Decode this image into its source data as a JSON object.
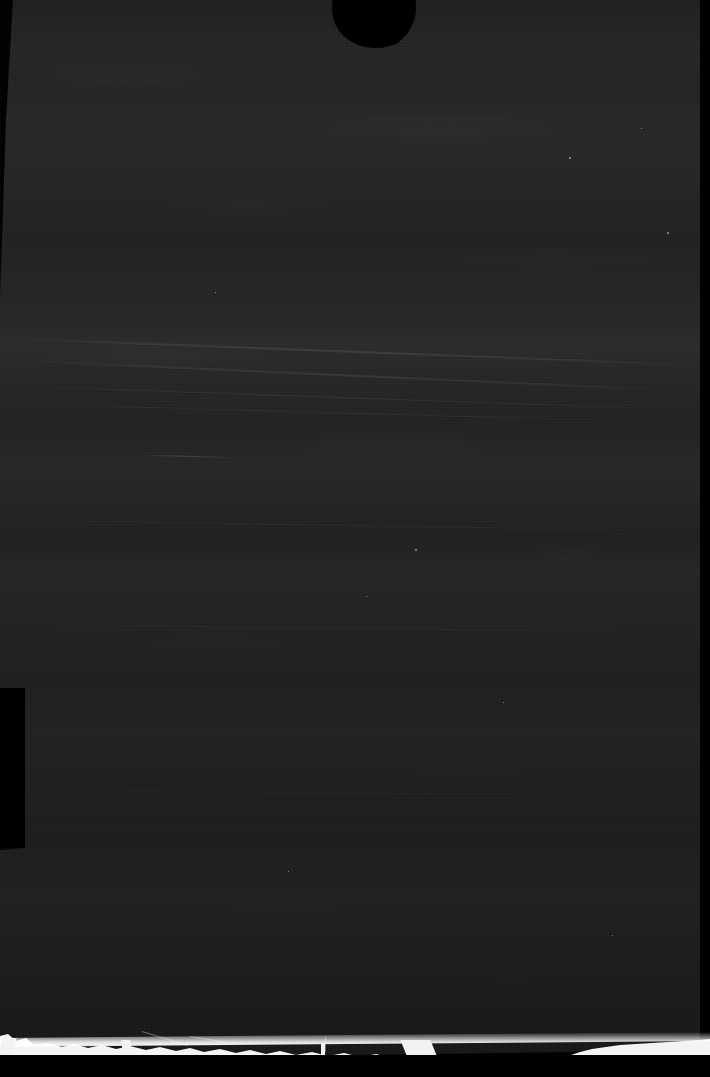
{
  "image": {
    "kind": "scanned-film-negative",
    "title": "Scanned Dark Film Negative",
    "caption": "Heavily underexposed scan of a torn sheet",
    "width_px": 710,
    "height_px": 1077,
    "legible_text": "none",
    "notes": "No readable text, labels, numbers or UI controls are present in the pixels."
  },
  "palette": {
    "background": "#000000",
    "surface_dark": "#1c1c1d",
    "surface_mid": "#232324",
    "surface_light": "#2a2a2b",
    "cutout": "#000000",
    "torn_edge_white": "#f4f4f2",
    "speck": "#ffffff"
  },
  "regions": {
    "surface": {
      "name": "emulsion-surface",
      "description": "Large dark charcoal textured field occupying most of the frame, with soft horizontal tonal banding and fine vertical scan grain."
    },
    "top_notch": {
      "name": "top-circular-cutout",
      "description": "Black rounded cutout at the top centre of the sheet.",
      "x": 332,
      "y": -30,
      "width": 84,
      "height": 78
    },
    "left_notch": {
      "name": "left-rectangular-cutout",
      "description": "Black rectangular step cut into the left edge.",
      "x": 0,
      "y": 688,
      "width": 25,
      "height": 160
    },
    "left_edge": {
      "name": "left-border-strip",
      "description": "Black border strip down the left side, widest at the top and tapering toward the bottom."
    },
    "right_edge": {
      "name": "right-border-strip",
      "description": "Narrow black border strip down the right side.",
      "x": 700,
      "width": 10
    },
    "bottom_tear": {
      "name": "torn-bottom-edge",
      "description": "Bright white ragged torn paper edge running across the bottom, heavier and more irregular on the left half, thinning to a clean hairline on the right.",
      "y": 1032,
      "height": 28
    }
  },
  "artifacts": {
    "streaks": [
      {
        "name": "diagonal-light-streak-1",
        "x": 20,
        "y": 338,
        "width": 660,
        "height": 2,
        "rotate_deg": 2.2,
        "opacity": 0.55
      },
      {
        "name": "diagonal-light-streak-2",
        "x": 30,
        "y": 360,
        "width": 640,
        "height": 2,
        "rotate_deg": 2.6,
        "opacity": 0.45
      },
      {
        "name": "diagonal-light-streak-3",
        "x": 25,
        "y": 386,
        "width": 650,
        "height": 1,
        "rotate_deg": 2.0,
        "opacity": 0.4
      },
      {
        "name": "diagonal-light-streak-4",
        "x": 40,
        "y": 404,
        "width": 600,
        "height": 1,
        "rotate_deg": 1.6,
        "opacity": 0.3
      },
      {
        "name": "short-light-streak-mid",
        "x": 148,
        "y": 455,
        "width": 86,
        "height": 1,
        "rotate_deg": 1.4,
        "opacity": 0.85
      },
      {
        "name": "diagonal-light-streak-5",
        "x": 35,
        "y": 520,
        "width": 620,
        "height": 1,
        "rotate_deg": 0.9,
        "opacity": 0.22
      },
      {
        "name": "diagonal-light-streak-6",
        "x": 40,
        "y": 624,
        "width": 600,
        "height": 1,
        "rotate_deg": 0.7,
        "opacity": 0.18
      },
      {
        "name": "diagonal-light-streak-7",
        "x": 45,
        "y": 790,
        "width": 580,
        "height": 1,
        "rotate_deg": 0.5,
        "opacity": 0.14
      }
    ],
    "specks": [
      {
        "name": "bright-speck-1",
        "x": 569,
        "y": 157,
        "size": 2
      },
      {
        "name": "bright-speck-2",
        "x": 667,
        "y": 232,
        "size": 2
      },
      {
        "name": "bright-speck-3",
        "x": 415,
        "y": 549,
        "size": 2
      },
      {
        "name": "bright-speck-4",
        "x": 366,
        "y": 596,
        "size": 1
      },
      {
        "name": "bright-speck-5",
        "x": 641,
        "y": 128,
        "size": 1
      },
      {
        "name": "bright-speck-6",
        "x": 215,
        "y": 292,
        "size": 1
      },
      {
        "name": "bright-speck-7",
        "x": 503,
        "y": 702,
        "size": 1
      },
      {
        "name": "bright-speck-8",
        "x": 288,
        "y": 871,
        "size": 1
      },
      {
        "name": "bright-speck-9",
        "x": 612,
        "y": 935,
        "size": 1
      }
    ],
    "tear_fragments": [
      {
        "name": "tear-fragment-left",
        "x": 0,
        "y": 1038,
        "width": 14,
        "height": 20,
        "skew_deg": -14
      },
      {
        "name": "tear-fragment-mid",
        "x": 122,
        "y": 1040,
        "width": 9,
        "height": 14,
        "skew_deg": 6
      },
      {
        "name": "tear-fragment-right",
        "x": 404,
        "y": 1040,
        "width": 30,
        "height": 18,
        "skew_deg": 22
      },
      {
        "name": "tear-fragment-spike",
        "x": 321,
        "y": 1043,
        "width": 4,
        "height": 12,
        "skew_deg": 0
      }
    ],
    "scratches": [
      {
        "name": "scratch-diagonal-1",
        "x": 142,
        "y": 1031,
        "width": 48,
        "height": 1,
        "rotate_deg": 17
      },
      {
        "name": "scratch-diagonal-2",
        "x": 190,
        "y": 1036,
        "width": 40,
        "height": 1,
        "rotate_deg": 9
      },
      {
        "name": "scratch-vertical-1",
        "x": 325,
        "y": 1036,
        "width": 1,
        "height": 16,
        "rotate_deg": 0
      }
    ]
  }
}
